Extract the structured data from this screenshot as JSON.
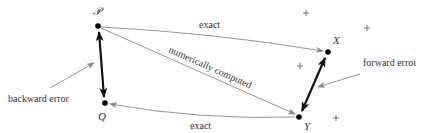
{
  "diagram": {
    "colors": {
      "background": "#ffffff",
      "thin_arrow": "#8a8a8a",
      "thick_arrow": "#111111",
      "point": "#000000",
      "text": "#333333"
    },
    "points": {
      "P": {
        "label": "𝒫",
        "x": 98,
        "y": 26
      },
      "Q": {
        "label": "Q",
        "x": 105,
        "y": 103
      },
      "X": {
        "label": "X",
        "x": 328,
        "y": 52
      },
      "Y": {
        "label": "Y",
        "x": 299,
        "y": 117
      }
    },
    "crosses": [
      {
        "x": 306,
        "y": 13
      },
      {
        "x": 367,
        "y": 28
      },
      {
        "x": 300,
        "y": 66
      },
      {
        "x": 336,
        "y": 118
      }
    ],
    "edges": {
      "p_to_x": {
        "label": "exact"
      },
      "p_to_y": {
        "label": "numerically computed"
      },
      "y_to_q": {
        "label": "exact"
      }
    },
    "annotations": {
      "backward_error": "backward error",
      "forward_error": "forward erroı"
    }
  }
}
